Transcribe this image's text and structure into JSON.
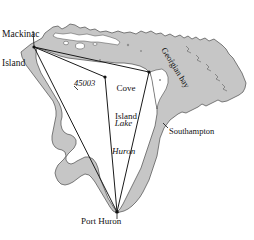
{
  "map": {
    "region_name": "Lake Huron",
    "colors": {
      "land": "#c6c6c6",
      "land_outline": "#4a4a4a",
      "water": "#ffffff",
      "line": "#1a1a1a",
      "text": "#111111",
      "background": "#ffffff"
    },
    "labels": {
      "mackinac_island_line1": "Mackinac",
      "mackinac_island_line2": "Island",
      "cove_island_line1": "Cove",
      "cove_island_line2": "Island",
      "lake_huron_line1": "Lake",
      "lake_huron_line2": "Huron",
      "buoy_45003": "45003",
      "southampton": "Southampton",
      "port_huron": "Port Huron",
      "georgian_bay": "Georgian bay"
    },
    "nodes": [
      {
        "name": "mackinac-island",
        "x": 34,
        "y": 47
      },
      {
        "name": "cove-island",
        "x": 149,
        "y": 72
      },
      {
        "name": "buoy-45003",
        "x": 105,
        "y": 77
      },
      {
        "name": "port-huron",
        "x": 117,
        "y": 212
      }
    ],
    "network_lines": [
      {
        "from": "mackinac-island",
        "to": "cove-island"
      },
      {
        "from": "mackinac-island",
        "to": "port-huron"
      },
      {
        "from": "cove-island",
        "to": "port-huron"
      },
      {
        "from": "mackinac-island",
        "to": "buoy-45003"
      },
      {
        "from": "buoy-45003",
        "to": "port-huron"
      }
    ]
  }
}
